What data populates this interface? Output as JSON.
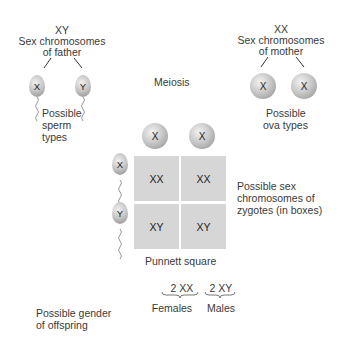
{
  "father": {
    "genotype": "XY",
    "label_line1": "Sex chromosomes",
    "label_line2": "of father",
    "sperm": [
      {
        "chromosome": "X"
      },
      {
        "chromosome": "Y"
      }
    ],
    "types_line1": "Possible",
    "types_line2": "sperm",
    "types_line3": "types"
  },
  "mother": {
    "genotype": "XX",
    "label_line1": "Sex chromosomes",
    "label_line2": "of mother",
    "ova": [
      {
        "chromosome": "X"
      },
      {
        "chromosome": "X"
      }
    ],
    "types_line1": "Possible",
    "types_line2": "ova types"
  },
  "process_label": "Meiosis",
  "punnett": {
    "top": [
      "X",
      "X"
    ],
    "side": [
      "X",
      "Y"
    ],
    "cells": [
      [
        "XX",
        "XX"
      ],
      [
        "XY",
        "XY"
      ]
    ],
    "caption": "Punnett square",
    "note_line1": "Possible sex",
    "note_line2": "chromosomes of",
    "note_line3": "zygotes (in boxes)"
  },
  "offspring": {
    "label_line1": "Possible gender",
    "label_line2": "of offspring",
    "groups": [
      {
        "count": "2 XX",
        "gender": "Females"
      },
      {
        "count": "2 XY",
        "gender": "Males"
      }
    ]
  },
  "colors": {
    "cell_fill": "#d6d6d6",
    "text": "#3a3a3a",
    "background": "#ffffff"
  }
}
